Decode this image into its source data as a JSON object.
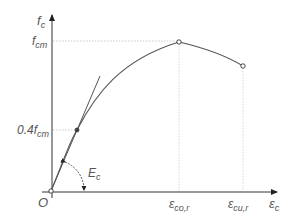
{
  "diagram": {
    "type": "stress-strain curve",
    "axes": {
      "y_label": "f",
      "y_label_sub": "c",
      "x_label": "ε",
      "x_label_sub": "c",
      "origin_label": "O"
    },
    "levels": {
      "fcm_label": "f",
      "fcm_sub": "cm",
      "fcm04_label": "0.4f",
      "fcm04_sub": "cm"
    },
    "strains": {
      "eco_label": "ε",
      "eco_sub": "co,r",
      "ecu_label": "ε",
      "ecu_sub": "cu,r"
    },
    "modulus": {
      "label": "E",
      "sub": "c"
    },
    "points": [
      {
        "name": "origin",
        "x": 51,
        "y": 191
      },
      {
        "name": "0.4fcm-point",
        "x": 77,
        "y": 130
      },
      {
        "name": "peak",
        "x": 179,
        "y": 42
      },
      {
        "name": "ultimate",
        "x": 243,
        "y": 66
      }
    ],
    "colors": {
      "line": "#555555",
      "guide": "#bbbbbb",
      "text": "#555555"
    }
  }
}
